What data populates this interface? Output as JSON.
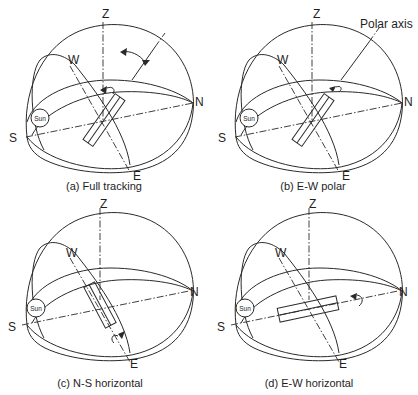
{
  "figure": {
    "panels": [
      {
        "id": "a",
        "caption": "(a) Full tracking",
        "labels": {
          "z": "Z",
          "w": "W",
          "n": "N",
          "s": "S",
          "e": "E",
          "sun": "Sun"
        }
      },
      {
        "id": "b",
        "caption": "(b) E-W polar",
        "labels": {
          "z": "Z",
          "w": "W",
          "n": "N",
          "s": "S",
          "e": "E",
          "sun": "Sun"
        },
        "annotation": "Polar axis"
      },
      {
        "id": "c",
        "caption": "(c) N-S horizontal",
        "labels": {
          "z": "Z",
          "w": "W",
          "n": "N",
          "s": "S",
          "e": "E",
          "sun": "Sun"
        }
      },
      {
        "id": "d",
        "caption": "(d) E-W horizontal",
        "labels": {
          "z": "Z",
          "w": "W",
          "n": "N",
          "s": "S",
          "e": "E",
          "sun": "Sun"
        }
      }
    ]
  },
  "colors": {
    "ink": "#2a2a2a",
    "background": "#ffffff"
  }
}
